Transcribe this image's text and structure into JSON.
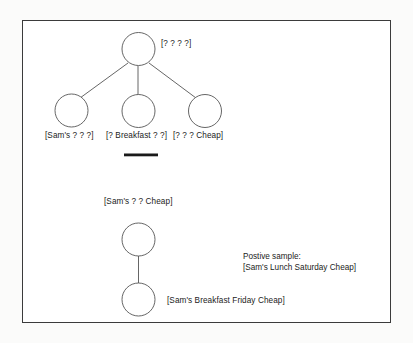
{
  "figure": {
    "background_color": "#fbfbfa",
    "panel_color": "#ffffff",
    "border_color": "#3b3b3b",
    "stroke_color": "#4a4a4a",
    "text_color": "#1b1b1b",
    "separator_color": "#1a1a1a"
  },
  "upper_tree": {
    "root": {
      "label": "[? ? ? ?]",
      "node_name": "root-node"
    },
    "children": [
      {
        "label": "[Sam's ? ? ?]",
        "node_name": "child-node-left"
      },
      {
        "label": "[? Breakfast ? ?]",
        "node_name": "child-node-middle"
      },
      {
        "label": "[? ? ? Cheap]",
        "node_name": "child-node-right"
      }
    ]
  },
  "separator": {
    "name": "horizontal-rule"
  },
  "lower_pair": {
    "top": {
      "label": "[Sam's ? ? Cheap]",
      "node_name": "lower-top-node"
    },
    "bottom": {
      "label": "[Sam's Breakfast Friday Cheap]",
      "node_name": "lower-bottom-node"
    }
  },
  "caption": {
    "heading": "Postive sample:",
    "value": "[Sam's Lunch Saturday Cheap]"
  }
}
